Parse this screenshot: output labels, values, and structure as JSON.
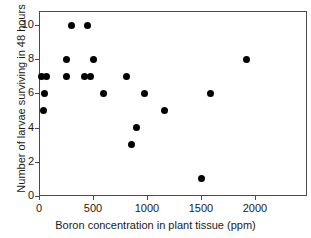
{
  "chart_data": {
    "type": "scatter",
    "title": "",
    "xlabel": "Boron concentration in plant tissue (ppm)",
    "ylabel": "Number of larvae surviving in 48 hours",
    "xlim": [
      0,
      2400
    ],
    "ylim": [
      0,
      11
    ],
    "xticks": [
      0,
      500,
      1000,
      1500,
      2000
    ],
    "xtick_labels": [
      "0",
      "500",
      "1000",
      "1500",
      "2000"
    ],
    "yticks": [
      0,
      2,
      4,
      6,
      8,
      10
    ],
    "ytick_labels": [
      "0",
      "2",
      "4",
      "6",
      "8",
      "10"
    ],
    "grid": false,
    "legend": null,
    "marker": "filled-circle",
    "marker_color": "#000000",
    "frame": true,
    "series": [
      {
        "name": "larvae survival",
        "points": [
          {
            "x": 20,
            "y": 7
          },
          {
            "x": 70,
            "y": 7
          },
          {
            "x": 55,
            "y": 6
          },
          {
            "x": 45,
            "y": 5
          },
          {
            "x": 250,
            "y": 8
          },
          {
            "x": 250,
            "y": 7
          },
          {
            "x": 300,
            "y": 10
          },
          {
            "x": 420,
            "y": 7
          },
          {
            "x": 450,
            "y": 10
          },
          {
            "x": 475,
            "y": 7
          },
          {
            "x": 500,
            "y": 8
          },
          {
            "x": 600,
            "y": 6
          },
          {
            "x": 810,
            "y": 7
          },
          {
            "x": 860,
            "y": 3
          },
          {
            "x": 905,
            "y": 4
          },
          {
            "x": 980,
            "y": 6
          },
          {
            "x": 1160,
            "y": 5
          },
          {
            "x": 1500,
            "y": 1
          },
          {
            "x": 1590,
            "y": 6
          },
          {
            "x": 1920,
            "y": 8
          }
        ]
      }
    ]
  },
  "figure": {
    "background_color": "#ffffff",
    "axis_color": "#4a4a4a",
    "text_color": "#1a1a1a"
  }
}
